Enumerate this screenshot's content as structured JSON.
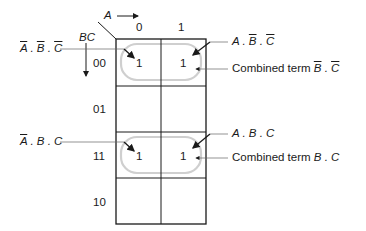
{
  "diagram": {
    "type": "karnaugh-map",
    "column_variable": "A",
    "row_variable": "BC",
    "column_headers": [
      "0",
      "1"
    ],
    "row_headers": [
      "00",
      "01",
      "11",
      "10"
    ],
    "cells": [
      [
        "1",
        "1"
      ],
      [
        "",
        ""
      ],
      [
        "1",
        "1"
      ],
      [
        "",
        ""
      ]
    ],
    "annotations": {
      "left_top": {
        "parts": [
          "A",
          " . ",
          "B",
          " . ",
          "C"
        ],
        "overlines": [
          true,
          false,
          true,
          false,
          true
        ]
      },
      "right_top": {
        "parts": [
          "A",
          " . ",
          "B",
          " . ",
          "C"
        ],
        "overlines": [
          false,
          false,
          true,
          false,
          true
        ]
      },
      "combined_top": {
        "prefix": "Combined term ",
        "parts": [
          "B",
          " . ",
          "C"
        ],
        "overlines": [
          true,
          false,
          true
        ]
      },
      "left_bottom": {
        "parts": [
          "A",
          " . ",
          "B",
          " . ",
          "C"
        ],
        "overlines": [
          true,
          false,
          false,
          false,
          false
        ]
      },
      "right_bottom": {
        "parts": [
          "A",
          " . ",
          "B",
          " . ",
          "C"
        ],
        "overlines": [
          false,
          false,
          false,
          false,
          false
        ]
      },
      "combined_bottom": {
        "prefix": "Combined term ",
        "parts": [
          "B",
          " . ",
          "C"
        ],
        "overlines": [
          false,
          false,
          false
        ]
      }
    },
    "colors": {
      "grid": "#1a1a1a",
      "group_loop": "#c8c8c8",
      "leader": "#555555"
    }
  }
}
